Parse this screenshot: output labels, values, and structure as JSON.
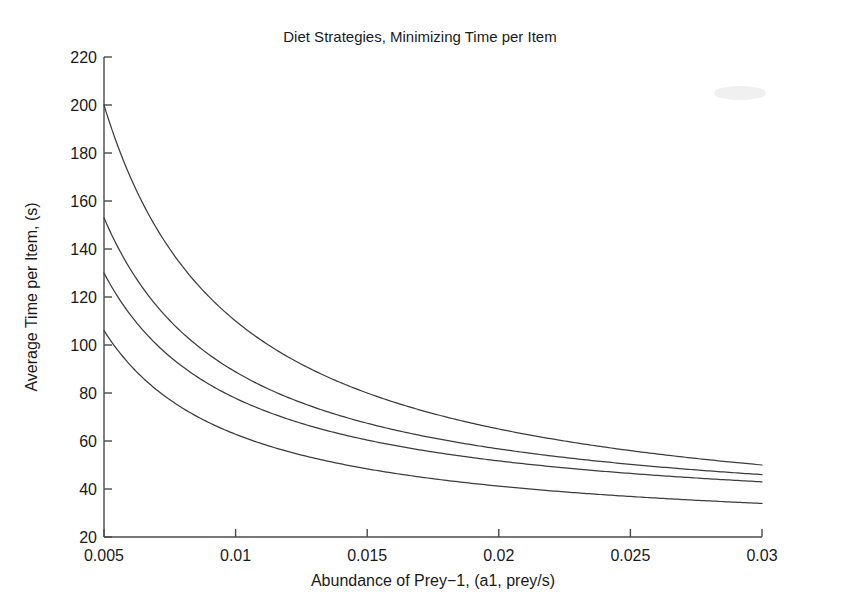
{
  "chart_data": {
    "type": "line",
    "title": "Diet Strategies, Minimizing Time per Item",
    "xlabel": "Abundance of Prey−1, (a1, prey/s)",
    "ylabel": "Average Time per Item, (s)",
    "xlim": [
      0.005,
      0.03
    ],
    "ylim": [
      20,
      220
    ],
    "xticks": [
      0.005,
      0.01,
      0.015,
      0.02,
      0.025,
      0.03
    ],
    "xtick_labels": [
      "0.005",
      "0.01",
      "0.015",
      "0.02",
      "0.025",
      "0.03"
    ],
    "yticks": [
      20,
      40,
      60,
      80,
      100,
      120,
      140,
      160,
      180,
      200,
      220
    ],
    "ytick_labels": [
      "20",
      "40",
      "60",
      "80",
      "100",
      "120",
      "140",
      "160",
      "180",
      "200",
      "220"
    ],
    "grid": false,
    "legend": null,
    "legend_position": "none",
    "box": false,
    "crossing_point": {
      "x": 0.0168,
      "y": 59
    },
    "x": [
      0.005,
      0.006,
      0.007,
      0.008,
      0.009,
      0.01,
      0.011,
      0.012,
      0.013,
      0.014,
      0.015,
      0.016,
      0.017,
      0.018,
      0.019,
      0.02,
      0.021,
      0.022,
      0.023,
      0.024,
      0.025,
      0.026,
      0.027,
      0.028,
      0.029,
      0.03
    ],
    "series": [
      {
        "name": "Strategy 1",
        "values": [
          200.0,
          175.2,
          157.5,
          144.3,
          134.0,
          125.8,
          119.1,
          113.5,
          108.8,
          104.8,
          101.3,
          98.2,
          95.5,
          93.1,
          91.0,
          89.0,
          87.3,
          85.7,
          84.2,
          82.9,
          81.7,
          80.6,
          79.5,
          78.6,
          77.7,
          76.8
        ]
      },
      {
        "name": "Strategy 2",
        "values": [
          153.0,
          137.5,
          126.4,
          118.1,
          111.7,
          106.5,
          102.3,
          98.8,
          95.8,
          93.3,
          91.1,
          89.1,
          87.4,
          85.9,
          84.5,
          83.3,
          82.2,
          81.2,
          80.3,
          79.4,
          78.7,
          78.0,
          77.3,
          76.7,
          76.2,
          75.7
        ]
      },
      {
        "name": "Strategy 3",
        "values": [
          130.0,
          118.3,
          110.0,
          103.8,
          98.9,
          95.0,
          91.8,
          89.2,
          86.9,
          85.0,
          83.4,
          81.9,
          80.6,
          79.4,
          78.4,
          77.5,
          76.7,
          75.9,
          75.2,
          74.6,
          74.0,
          73.5,
          73.0,
          72.6,
          72.2,
          71.8
        ]
      },
      {
        "name": "Strategy 4",
        "values": [
          106.0,
          98.5,
          93.1,
          89.1,
          85.9,
          83.4,
          81.3,
          79.6,
          78.1,
          76.9,
          75.8,
          74.9,
          74.0,
          73.3,
          72.6,
          72.0,
          71.5,
          71.0,
          70.6,
          70.2,
          69.8,
          69.5,
          69.1,
          68.9,
          68.6,
          68.3
        ]
      }
    ],
    "curve_endpoints": {
      "left_values": [
        200,
        153,
        130,
        106
      ],
      "right_values": [
        50,
        46,
        43,
        34
      ]
    }
  }
}
